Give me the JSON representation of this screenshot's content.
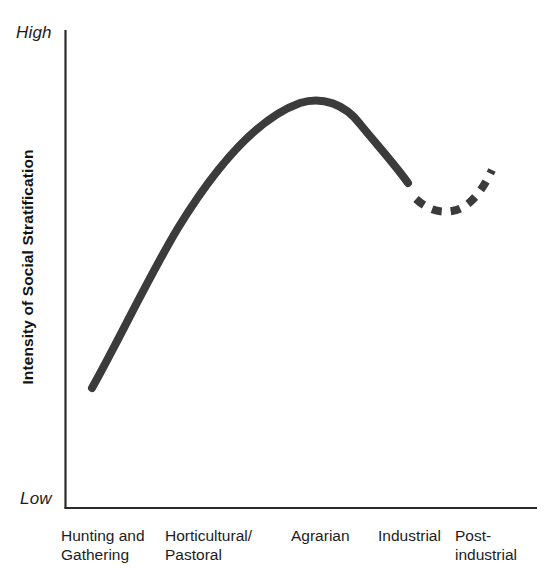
{
  "chart_data": {
    "type": "line",
    "title": "",
    "subtitle": "",
    "xlabel": "",
    "ylabel": "Intensity of Social Stratification",
    "y_axis_extremes": {
      "high": "High",
      "low": "Low"
    },
    "ylim": [
      0,
      100
    ],
    "grid": false,
    "legend": null,
    "categories": [
      "Hunting and\nGathering",
      "Horticultural/\nPastoral",
      "Agrarian",
      "Industrial",
      "Post-\nindustrial"
    ],
    "category_labels_flat": [
      "Hunting and Gathering",
      "Horticultural/Pastoral",
      "Agrarian",
      "Industrial",
      "Post-industrial"
    ],
    "series": [
      {
        "name": "Intensity of Social Stratification (observed)",
        "style": "solid",
        "color": "#3b3b3b",
        "x": [
          "Hunting and Gathering",
          "Horticultural/Pastoral",
          "Agrarian",
          "Industrial"
        ],
        "values": [
          25,
          62,
          85,
          62
        ]
      },
      {
        "name": "Intensity of Social Stratification (projected)",
        "style": "dashed",
        "color": "#3b3b3b",
        "x": [
          "Industrial",
          "Post-industrial"
        ],
        "values": [
          58,
          66
        ]
      }
    ],
    "annotations": []
  },
  "axes": {
    "y_axis_name": "vertical-axis-line",
    "x_axis_name": "horizontal-axis-line",
    "line_color": "#2a2a2a"
  },
  "curve": {
    "solid_path": "M 92 388 C 120 338 148 278 178 228 C 210 176 252 120 300 103 C 322 96 345 104 360 124 C 378 146 396 166 408 183",
    "dash_path": "M 416 199 C 428 210 440 213 452 211 C 466 209 480 196 492 170",
    "stroke_color": "#3b3b3b",
    "solid_width": 8,
    "dash_width": 8,
    "dash_pattern": "10 9"
  }
}
